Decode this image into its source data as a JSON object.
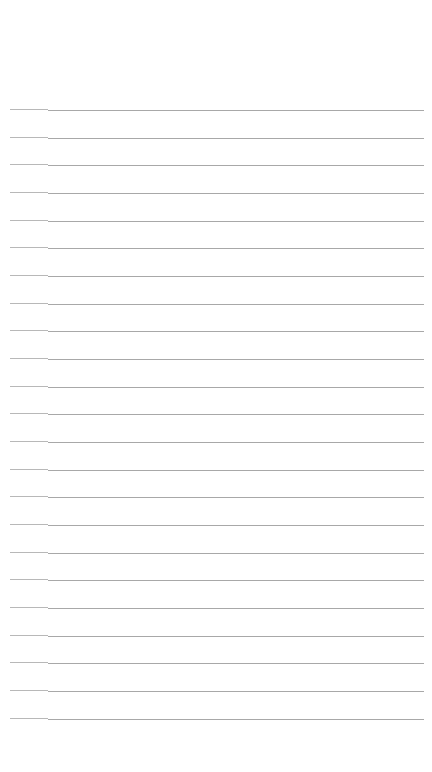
{
  "page": {
    "type": "lined-paper",
    "background": "#ffffff",
    "line_color": "#a8a8a8",
    "first_line_y": 109,
    "line_spacing": 27.67,
    "line_count": 23,
    "line_left_x": 10,
    "line_right_x": 424
  }
}
